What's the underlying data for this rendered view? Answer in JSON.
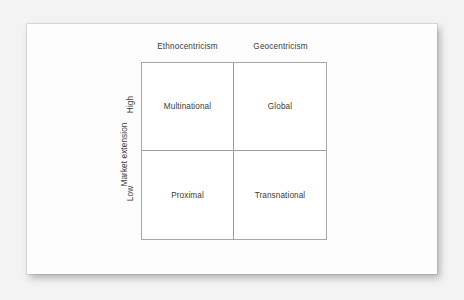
{
  "diagram": {
    "type": "2x2-matrix",
    "column_headers": [
      "Ethnocentricism",
      "Geocentricism"
    ],
    "y_axis": {
      "title": "Market extension",
      "ticks": [
        "High",
        "Low"
      ]
    },
    "cells": [
      {
        "row": "High",
        "column": "Ethnocentricism",
        "label": "Multinational"
      },
      {
        "row": "High",
        "column": "Geocentricism",
        "label": "Global"
      },
      {
        "row": "Low",
        "column": "Ethnocentricism",
        "label": "Proximal"
      },
      {
        "row": "Low",
        "column": "Geocentricism",
        "label": "Transnational"
      }
    ],
    "colors": {
      "backdrop": "#f3f3f3",
      "page": "#fdfdfd",
      "grid_line": "#9e9e9e",
      "border": "#a8a8a8",
      "text": "#3b3b3b"
    }
  }
}
